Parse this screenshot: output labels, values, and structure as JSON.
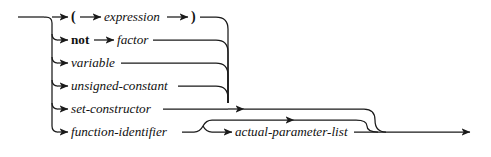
{
  "diagram": {
    "kind": "railroad-syntax-diagram",
    "title": "factor",
    "colors": {
      "line": "#1a1a1a",
      "text": "#111111",
      "background": "#ffffff"
    },
    "geometry": {
      "width": 491,
      "height": 157,
      "entry_x": 18,
      "spine_x": 52,
      "collector_x": 228,
      "exit_x": 470,
      "row_y": [
        17,
        40,
        63,
        86,
        109,
        132
      ]
    },
    "alternatives": [
      {
        "index": 0,
        "row_y": 17,
        "kind": "sequence",
        "parts": [
          {
            "type": "terminal",
            "label": "("
          },
          {
            "type": "nonterminal",
            "label": "expression"
          },
          {
            "type": "terminal",
            "label": ")"
          }
        ]
      },
      {
        "index": 1,
        "row_y": 40,
        "kind": "sequence",
        "parts": [
          {
            "type": "keyword",
            "label": "not"
          },
          {
            "type": "nonterminal",
            "label": "factor"
          }
        ]
      },
      {
        "index": 2,
        "row_y": 63,
        "kind": "single",
        "parts": [
          {
            "type": "nonterminal",
            "label": "variable"
          }
        ]
      },
      {
        "index": 3,
        "row_y": 86,
        "kind": "single",
        "parts": [
          {
            "type": "nonterminal",
            "label": "unsigned-constant"
          }
        ]
      },
      {
        "index": 4,
        "row_y": 109,
        "kind": "single",
        "parts": [
          {
            "type": "nonterminal",
            "label": "set-constructor"
          }
        ]
      },
      {
        "index": 5,
        "row_y": 132,
        "kind": "sequence-optional",
        "parts": [
          {
            "type": "nonterminal",
            "label": "function-identifier"
          },
          {
            "type": "nonterminal",
            "label": "actual-parameter-list",
            "optional": true
          }
        ]
      }
    ],
    "labels": {
      "open_paren": "(",
      "close_paren": ")",
      "expression": "expression",
      "not": "not",
      "factor": "factor",
      "variable": "variable",
      "unsigned_constant": "unsigned-constant",
      "set_constructor": "set-constructor",
      "function_identifier": "function-identifier",
      "actual_parameter_list": "actual-parameter-list"
    }
  }
}
